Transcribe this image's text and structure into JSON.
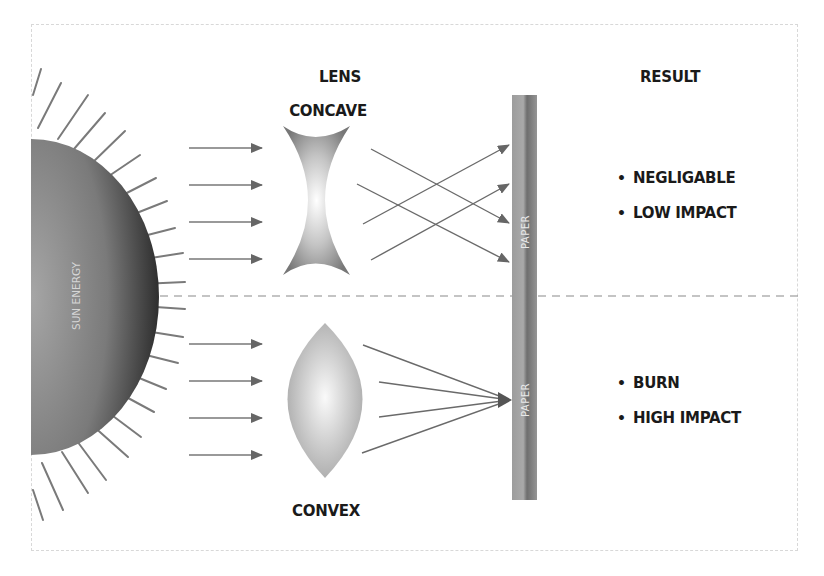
{
  "diagram": {
    "type": "optics-illustration",
    "source_label": "SUN ENERGY",
    "lens_header": "LENS",
    "result_header": "RESULT",
    "target_label": "PAPER",
    "top": {
      "lens_name": "CONCAVE",
      "target_label": "PAPER",
      "incoming_rays": 4,
      "outcome": [
        "NEGLIGABLE",
        "LOW IMPACT"
      ]
    },
    "bottom": {
      "lens_name": "CONVEX",
      "target_label": "PAPER",
      "incoming_rays": 4,
      "outcome": [
        "BURN",
        "HIGH IMPACT"
      ]
    },
    "bullet_glyph": "•",
    "colors": {
      "ink": "#1a1a1a",
      "ray": "#6e6e6e",
      "sun_dark": "#3a3a3a",
      "sun_light": "#9a9a9a",
      "paper": "#8a8a8a",
      "divider": "#888888"
    }
  }
}
